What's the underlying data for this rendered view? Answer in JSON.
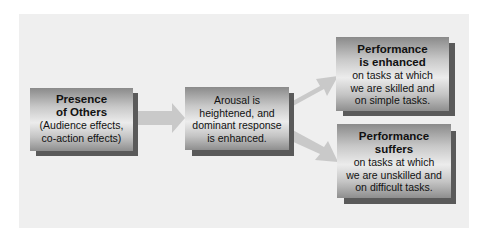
{
  "diagram": {
    "colors": {
      "panel": "#efefef",
      "arrow": "#c9c9c9",
      "box_dark": "#8a8a8a",
      "box_light": "#ececec",
      "shadow": "#5a5a5a"
    },
    "nodes": [
      {
        "id": "presence",
        "title": [
          "Presence",
          "of Others"
        ],
        "body": [
          "(Audience effects,",
          "co-action effects)"
        ]
      },
      {
        "id": "arousal",
        "title": [],
        "body": [
          "Arousal is",
          "heightened, and",
          "dominant response",
          "is enhanced."
        ]
      },
      {
        "id": "enhanced",
        "title": [
          "Performance",
          "is enhanced"
        ],
        "body": [
          "on tasks at which",
          "we are skilled and",
          "on simple tasks."
        ]
      },
      {
        "id": "suffers",
        "title": [
          "Performance",
          "suffers"
        ],
        "body": [
          "on tasks at which",
          "we are unskilled and",
          "on difficult tasks."
        ]
      }
    ],
    "edges": [
      {
        "from": "presence",
        "to": "arousal"
      },
      {
        "from": "arousal",
        "to": "enhanced"
      },
      {
        "from": "arousal",
        "to": "suffers"
      }
    ]
  }
}
